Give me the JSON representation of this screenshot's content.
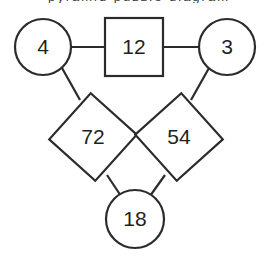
{
  "page": {
    "background_color": "#ffffff",
    "stroke_color": "#2b2b2b",
    "text_color": "#231f20"
  },
  "caption": {
    "clipped_text": "pyramid puzzle diagram"
  },
  "diagram": {
    "type": "number-puzzle-triangle",
    "nodes": [
      {
        "id": "top-left-circle",
        "shape": "circle",
        "value": "4",
        "cx": 43,
        "cy": 47,
        "r": 28
      },
      {
        "id": "top-square",
        "shape": "square",
        "value": "12",
        "cx": 134,
        "cy": 47,
        "size": 58
      },
      {
        "id": "top-right-circle",
        "shape": "circle",
        "value": "3",
        "cx": 227,
        "cy": 47,
        "r": 28
      },
      {
        "id": "left-diamond",
        "shape": "diamond",
        "value": "72",
        "cx": 93,
        "cy": 137,
        "size": 62,
        "rotation": 42
      },
      {
        "id": "right-diamond",
        "shape": "diamond",
        "value": "54",
        "cx": 179,
        "cy": 137,
        "size": 62,
        "rotation": -42
      },
      {
        "id": "bottom-circle",
        "shape": "circle",
        "value": "18",
        "cx": 135,
        "cy": 219,
        "r": 29
      }
    ],
    "connectors": [
      {
        "id": "connector-left-circle-to-square",
        "x1": 71,
        "y1": 47,
        "x2": 105,
        "y2": 47
      },
      {
        "id": "connector-square-to-right-circle",
        "x1": 163,
        "y1": 47,
        "x2": 199,
        "y2": 47
      },
      {
        "id": "connector-left-circle-to-left-diamond",
        "x1": 62,
        "y1": 68,
        "x2": 80,
        "y2": 100
      },
      {
        "id": "connector-right-circle-to-right-diamond",
        "x1": 209,
        "y1": 68,
        "x2": 191,
        "y2": 100
      },
      {
        "id": "connector-left-diamond-to-bottom-circle",
        "x1": 107,
        "y1": 175,
        "x2": 121,
        "y2": 196
      },
      {
        "id": "connector-right-diamond-to-bottom-circle",
        "x1": 165,
        "y1": 175,
        "x2": 150,
        "y2": 196
      }
    ]
  }
}
